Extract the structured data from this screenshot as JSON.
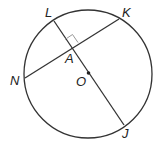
{
  "diagram": {
    "labels": {
      "L": "L",
      "K": "K",
      "A": "A",
      "N": "N",
      "O": "O",
      "J": "J"
    },
    "relations": [
      "LJ passes through center O",
      "NK ⟂ LJ at A"
    ],
    "colors": {
      "stroke": "#333333",
      "marker": "#999999"
    }
  }
}
